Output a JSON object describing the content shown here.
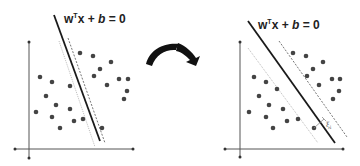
{
  "colors": {
    "line": "#1a1a1a",
    "dot": "#444444",
    "axis": "#555555",
    "dotted": "#9a9a9a",
    "dashed": "#666666",
    "arrow": "#111111"
  },
  "left_panel": {
    "equation": "wᵀx + b = 0",
    "equation_parts": {
      "w": "w",
      "T": "T",
      "rest": "x + ",
      "b": "b",
      "eq": " = 0"
    }
  },
  "right_panel": {
    "equation": "wᵀx + b = 0",
    "equation_parts": {
      "w": "w",
      "T": "T",
      "rest": "x + ",
      "b": "b",
      "eq": " = 0"
    },
    "slack_label": "ξᵢ",
    "slack_symbol": "ξ",
    "slack_sub": "i"
  },
  "transition_icon": "curved-arrow-right"
}
